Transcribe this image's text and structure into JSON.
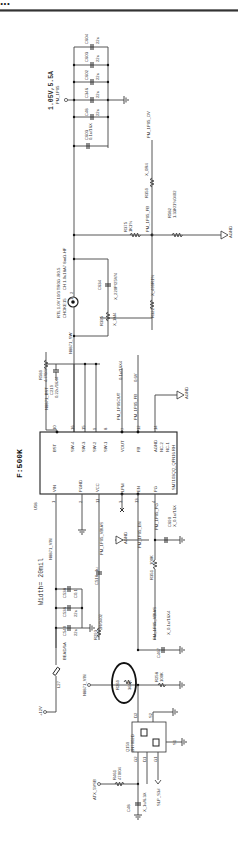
{
  "header": {
    "text": "...",
    "rule": true
  },
  "rail": {
    "voltage_label": "1.05V,5.5A",
    "net_name": "PM_1P05"
  },
  "output_caps": [
    {
      "ref": "C604",
      "value": "22u"
    },
    {
      "ref": "C603",
      "value": "22u"
    },
    {
      "ref": "C602",
      "value": "22u"
    },
    {
      "ref": "C346",
      "value": "22u"
    },
    {
      "ref": "C48",
      "value": "22u"
    },
    {
      "ref": "C603",
      "value": "0.1u/16X"
    }
  ],
  "feedback": {
    "ov_net": "PM_1P05_OV",
    "fb_net": "PM_1P05_FB",
    "r_top": {
      "ref": "R375",
      "value": "1K1%"
    },
    "r_bot": {
      "ref": "R582",
      "value": "1.33K/1%0402"
    },
    "r_ov": {
      "ref": "R359",
      "value": "X_0R4"
    },
    "r_comp": {
      "ref": "R322",
      "value": "X_499R1%"
    },
    "gnd_label": "AGND"
  },
  "inductor": {
    "ref": "CHOKE15",
    "value": "CH 1.0u18A7 8mΩ-HF",
    "part": "RTL 1.0V 10/3 TR0G -R0.5",
    "pin1": "1",
    "pin2": "2"
  },
  "snubber": {
    "cap": {
      "ref": "C634",
      "value": "X_220P/25V/4"
    },
    "res": {
      "ref": "R395",
      "value": "X_1M4"
    }
  },
  "boot": {
    "res": {
      "ref": "R589",
      "value": "4.7/0/4"
    },
    "cap": {
      "ref": "C219",
      "value": "0.22u/16X4"
    },
    "net": "N8871_BST",
    "sw_net": "N8871_SW"
  },
  "ic": {
    "ref": "U58",
    "part": "SM7103QQ_QFN16 RH",
    "freq_label": "F:500K",
    "left_pins": [
      {
        "num": "1",
        "name": "VIN"
      },
      {
        "num": "2",
        "name": "PGND"
      },
      {
        "num": "11",
        "name": "VCC"
      },
      {
        "num": "3",
        "name": "LPM"
      },
      {
        "num": "13",
        "name": "EN"
      },
      {
        "num": "4",
        "name": "PG"
      }
    ],
    "right_pins": [
      {
        "num": "10",
        "name": "BST"
      },
      {
        "num": "16",
        "name": "SW-4"
      },
      {
        "num": "15",
        "name": "SW-3"
      },
      {
        "num": "9",
        "name": "SW-2"
      },
      {
        "num": "8",
        "name": "SW-1"
      },
      {
        "num": "7",
        "name": "VOUT"
      },
      {
        "num": "12",
        "name": "FB"
      },
      {
        "num": "14",
        "name": "AGND"
      },
      {
        "num": "5",
        "name": "NC-2"
      },
      {
        "num": "6",
        "name": "NC-1"
      }
    ]
  },
  "nets": {
    "vout_sense": "PM_1P05OUT",
    "vout_cap": "0.1u/16X4",
    "fb_net": "PM_1P05_FB",
    "fb_voltage": "0.6V",
    "vin_net": "N8871_VIN",
    "width_note": "Width= 20mil",
    "vbias": "PM_1P05_VBIAS",
    "en": "PM_1P05_EN",
    "pg": "PM_1P05_PG",
    "pg_cap": {
      "ref": "C690",
      "value": "X_0.1u/16X"
    },
    "vbias_res": "R351",
    "vbias_res_val": "100K",
    "agnd": "AGND"
  },
  "input": {
    "inductor": {
      "ref": "L27",
      "value": "BEAD/6A"
    },
    "caps": [
      {
        "ref": "C538",
        "value": "C0.1"
      },
      {
        "ref": "C536",
        "value": "22u"
      },
      {
        "ref": "C540",
        "value": "22u"
      }
    ],
    "vcc_cap": {
      "ref": "C518",
      "value": "1u"
    },
    "vcc_res": {
      "ref": "R293",
      "value": "2R/0402"
    },
    "rail_label": "+12V"
  },
  "enable": {
    "r_circled": {
      "ref": "R269",
      "value": "360K"
    },
    "r_pulldown": {
      "ref": "R258",
      "value": "100K"
    },
    "cap": {
      "ref": "C467",
      "value": "X_0.1u/16X4"
    }
  },
  "mosfet": {
    "ref": "Q159",
    "part": "2N7002D",
    "pins": [
      "D2",
      "S2",
      "G2",
      "D1",
      "G1",
      "S1"
    ],
    "res": {
      "ref": "R461",
      "value": "470/04"
    },
    "cap": {
      "ref": "C48",
      "value": "X_1u/6.3X"
    },
    "in_net": "ATX_5VSB",
    "ctrl_net": "SLP_S3#"
  }
}
